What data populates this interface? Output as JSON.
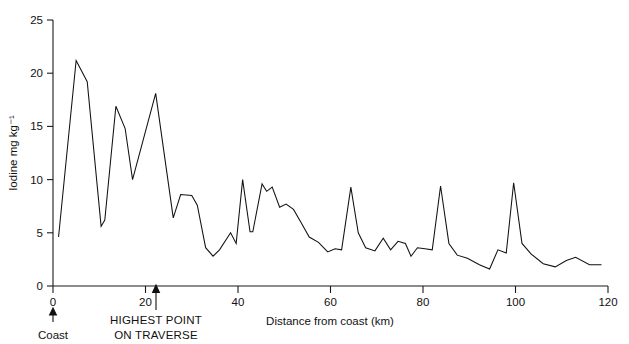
{
  "chart_data": {
    "type": "line",
    "title": "",
    "xlabel": "Distance from coast (km)",
    "ylabel": "Iodine mg kg⁻¹",
    "xlim": [
      0,
      120
    ],
    "ylim": [
      0,
      25
    ],
    "xticks": [
      0,
      20,
      40,
      60,
      80,
      100,
      120
    ],
    "yticks": [
      0,
      5,
      10,
      15,
      20,
      25
    ],
    "xtick_labels": [
      "0",
      "20",
      "40",
      "60",
      "80",
      "100",
      "120"
    ],
    "ytick_labels": [
      "0",
      "5",
      "10",
      "15",
      "20",
      "25"
    ],
    "grid": false,
    "legend": false,
    "series": [
      {
        "name": "Iodine",
        "x": [
          1.2,
          5.0,
          7.4,
          10.4,
          11.2,
          13.6,
          15.6,
          17.2,
          22.2,
          26.0,
          27.6,
          30.0,
          31.2,
          33.0,
          34.6,
          36.0,
          38.4,
          39.6,
          41.0,
          42.6,
          43.2,
          45.2,
          46.2,
          47.4,
          49.0,
          50.4,
          52.0,
          53.6,
          55.4,
          57.4,
          59.4,
          61.0,
          62.4,
          64.4,
          66.0,
          67.6,
          69.6,
          71.4,
          73.0,
          74.6,
          76.2,
          77.4,
          78.8,
          80.4,
          82.0,
          83.8,
          85.6,
          87.4,
          89.6,
          92.2,
          94.4,
          96.2,
          98.0,
          99.6,
          101.4,
          103.4,
          106.0,
          108.6,
          111.0,
          113.0,
          116.0,
          118.6
        ],
        "y": [
          4.6,
          21.2,
          19.2,
          5.6,
          6.2,
          16.9,
          14.8,
          10.0,
          18.1,
          6.4,
          8.6,
          8.5,
          7.6,
          3.6,
          2.8,
          3.4,
          5.0,
          4.0,
          10.0,
          5.1,
          5.1,
          9.6,
          8.9,
          9.3,
          7.4,
          7.7,
          7.2,
          6.0,
          4.6,
          4.1,
          3.2,
          3.5,
          3.4,
          9.3,
          5.0,
          3.6,
          3.3,
          4.5,
          3.4,
          4.2,
          4.0,
          2.8,
          3.6,
          3.5,
          3.4,
          9.4,
          4.0,
          2.9,
          2.6,
          2.0,
          1.6,
          3.4,
          3.1,
          9.7,
          4.0,
          3.0,
          2.1,
          1.8,
          2.4,
          2.7,
          2.0,
          2.0
        ]
      }
    ],
    "annotations": [
      {
        "id": "coast",
        "label": "Coast",
        "x": 0,
        "arrow": "up"
      },
      {
        "id": "highest-point",
        "label_line1": "HIGHEST POINT",
        "label_line2": "ON TRAVERSE",
        "x": 22,
        "arrow": "up"
      }
    ]
  }
}
